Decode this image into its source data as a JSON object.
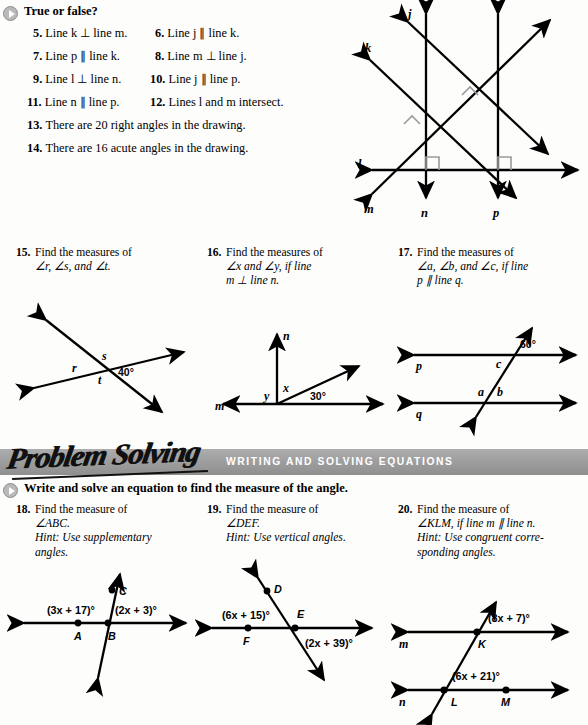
{
  "page": {
    "background": "#fdfdfc",
    "ink": "#000000",
    "banner_color": "#9c9c9c",
    "bullet_color": "#b9b9b9"
  },
  "section_true_false": {
    "bullet_icon": "play-triangle-icon",
    "heading": "True or false?",
    "items": [
      {
        "number": "5.",
        "text": "Line k ⊥ line m."
      },
      {
        "number": "6.",
        "text": "Line j ∥ line k."
      },
      {
        "number": "7.",
        "text": "Line p ∥ line k."
      },
      {
        "number": "8.",
        "text": "Line m ⊥ line j."
      },
      {
        "number": "9.",
        "text": "Line l ⊥ line n."
      },
      {
        "number": "10.",
        "text": "Line j ∥ line p."
      },
      {
        "number": "11.",
        "text": "Line n ∥ line p."
      },
      {
        "number": "12.",
        "text": "Lines l and m intersect."
      },
      {
        "number": "13.",
        "text": "There are 20 right angles in the drawing."
      },
      {
        "number": "14.",
        "text": "There are 16 acute angles in the drawing."
      }
    ]
  },
  "figure_lines": {
    "name": "multi-line-figure",
    "labels": [
      "j",
      "k",
      "l",
      "m",
      "n",
      "p"
    ],
    "right_angle_marks": 4
  },
  "exercises_middle": [
    {
      "number": "15.",
      "lines": [
        "Find the measures of",
        "∠r, ∠s, and ∠t."
      ],
      "figure": {
        "name": "two-intersecting-lines-rst",
        "angle_labels": [
          "r",
          "s",
          "t"
        ],
        "given_angle": "40°"
      }
    },
    {
      "number": "16.",
      "lines": [
        "Find the measures of",
        "∠x and ∠y, if line",
        "m ⊥ line n."
      ],
      "figure": {
        "name": "perpendicular-rays-xy",
        "angle_labels": [
          "x",
          "y"
        ],
        "line_labels": [
          "m",
          "n"
        ],
        "given_angle": "30°"
      }
    },
    {
      "number": "17.",
      "lines": [
        "Find the measures of",
        "∠a, ∠b, and ∠c, if line",
        "p ∥ line q."
      ],
      "figure": {
        "name": "parallel-lines-transversal-abc",
        "angle_labels": [
          "a",
          "b",
          "c"
        ],
        "line_labels": [
          "p",
          "q"
        ],
        "given_angle": "60°"
      }
    }
  ],
  "problem_solving": {
    "logo": "Problem Solving",
    "subtitle": "WRITING AND SOLVING EQUATIONS",
    "bullet_icon": "play-triangle-icon",
    "instruction": "Write and solve an equation to find the measure of the angle."
  },
  "exercises_bottom": [
    {
      "number": "18.",
      "lines": [
        "Find the measure of",
        "∠ABC.",
        "Hint: Use supplementary",
        "angles."
      ],
      "hint_start_line": 2,
      "figure": {
        "name": "angle-abc-figure",
        "point_labels": [
          "A",
          "B",
          "C"
        ],
        "expressions": [
          "(3x + 17)°",
          "(2x + 3)°"
        ]
      }
    },
    {
      "number": "19.",
      "lines": [
        "Find the measure of",
        "∠DEF.",
        "Hint: Use vertical angles."
      ],
      "hint_start_line": 2,
      "figure": {
        "name": "angle-def-figure",
        "point_labels": [
          "D",
          "E",
          "F"
        ],
        "expressions": [
          "(6x + 15)°",
          "(2x + 39)°"
        ]
      }
    },
    {
      "number": "20.",
      "lines": [
        "Find the measure of",
        "∠KLM, if line m ∥ line n.",
        "Hint: Use congruent corre-",
        "sponding angles."
      ],
      "hint_start_line": 2,
      "figure": {
        "name": "angle-klm-figure",
        "point_labels": [
          "K",
          "L",
          "M"
        ],
        "line_labels": [
          "m",
          "n"
        ],
        "expressions": [
          "(8x + 7)°",
          "(6x + 21)°"
        ]
      }
    }
  ]
}
